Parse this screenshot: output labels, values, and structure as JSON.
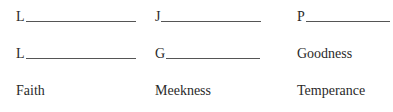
{
  "worksheet": {
    "rows": [
      [
        {
          "type": "blank",
          "letter": "L"
        },
        {
          "type": "blank",
          "letter": "J"
        },
        {
          "type": "blank",
          "letter": "P"
        }
      ],
      [
        {
          "type": "blank",
          "letter": "L"
        },
        {
          "type": "blank",
          "letter": "G"
        },
        {
          "type": "word",
          "text": "Goodness"
        }
      ],
      [
        {
          "type": "word",
          "text": "Faith"
        },
        {
          "type": "word",
          "text": "Meekness"
        },
        {
          "type": "word",
          "text": "Temperance"
        }
      ]
    ]
  }
}
